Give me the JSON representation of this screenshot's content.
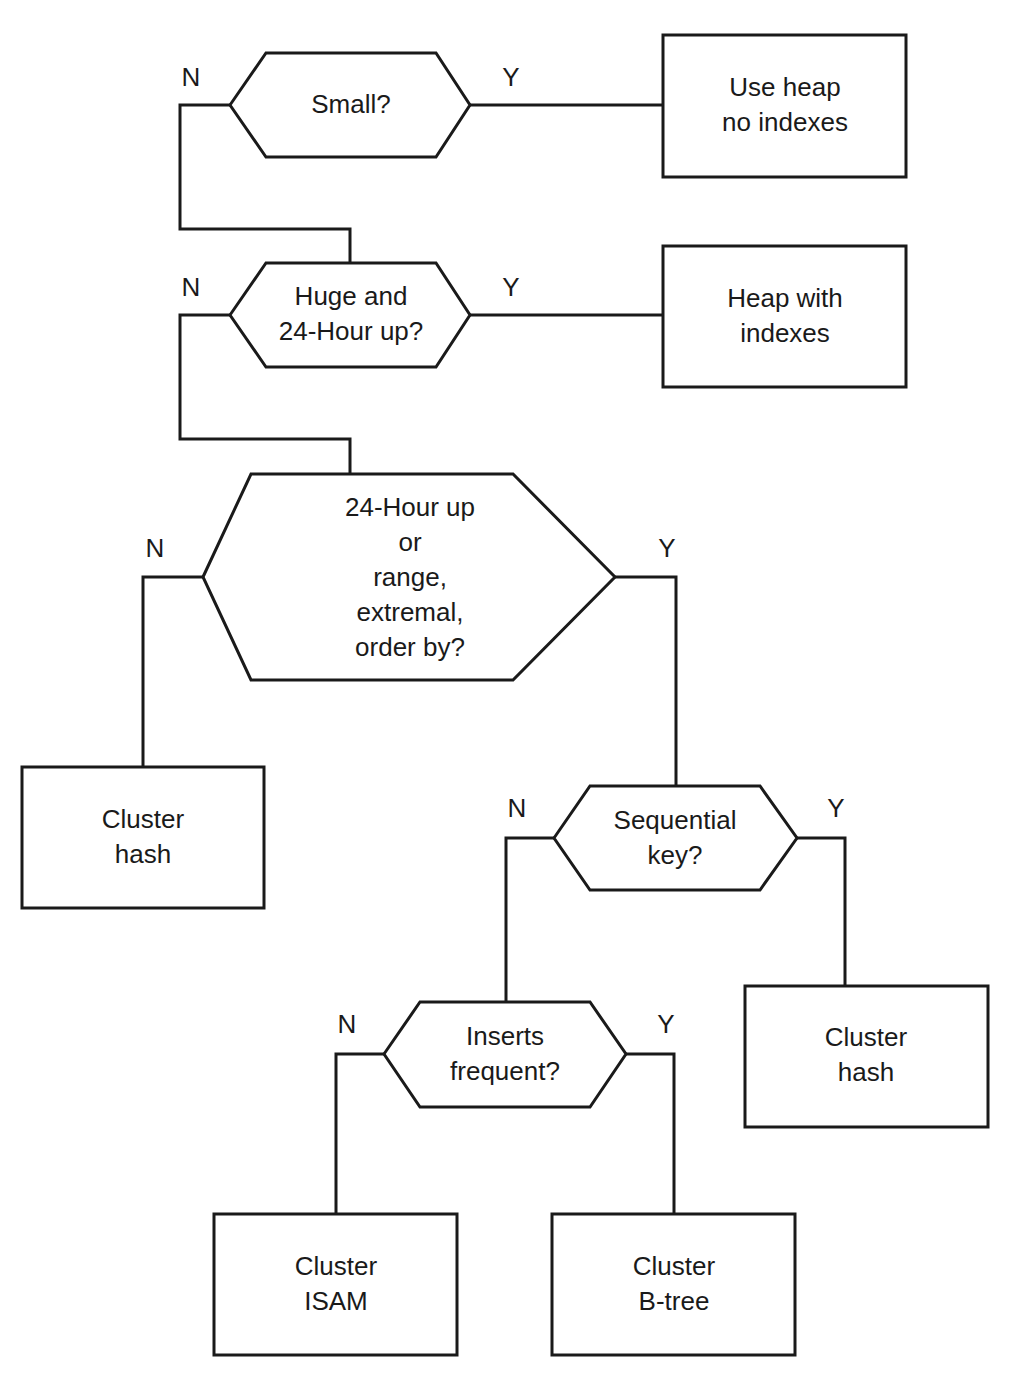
{
  "diagram": {
    "type": "flowchart",
    "colors": {
      "line": "#1a1a1a",
      "background": "#ffffff"
    },
    "decisions": [
      {
        "id": "small",
        "label": "Small?",
        "yes_label": "Y",
        "no_label": "N"
      },
      {
        "id": "huge",
        "label": "Huge and\n24-Hour up?",
        "yes_label": "Y",
        "no_label": "N"
      },
      {
        "id": "range",
        "label": "24-Hour up\nor\nrange,\nextremal,\norder by?",
        "yes_label": "Y",
        "no_label": "N"
      },
      {
        "id": "sequential",
        "label": "Sequential\nkey?",
        "yes_label": "Y",
        "no_label": "N"
      },
      {
        "id": "inserts",
        "label": "Inserts\nfrequent?",
        "yes_label": "Y",
        "no_label": "N"
      }
    ],
    "outcomes": [
      {
        "id": "heap-no-index",
        "label": "Use heap\nno indexes"
      },
      {
        "id": "heap-with-index",
        "label": "Heap with\nindexes"
      },
      {
        "id": "cluster-hash-left",
        "label": "Cluster\nhash"
      },
      {
        "id": "cluster-hash-right",
        "label": "Cluster\nhash"
      },
      {
        "id": "cluster-isam",
        "label": "Cluster\nISAM"
      },
      {
        "id": "cluster-btree",
        "label": "Cluster\nB-tree"
      }
    ],
    "edges": [
      {
        "from": "small",
        "to": "heap-no-index",
        "label": "Y"
      },
      {
        "from": "small",
        "to": "huge",
        "label": "N"
      },
      {
        "from": "huge",
        "to": "heap-with-index",
        "label": "Y"
      },
      {
        "from": "huge",
        "to": "range",
        "label": "N"
      },
      {
        "from": "range",
        "to": "cluster-hash-left",
        "label": "N"
      },
      {
        "from": "range",
        "to": "sequential",
        "label": "Y"
      },
      {
        "from": "sequential",
        "to": "cluster-hash-right",
        "label": "Y"
      },
      {
        "from": "sequential",
        "to": "inserts",
        "label": "N"
      },
      {
        "from": "inserts",
        "to": "cluster-isam",
        "label": "N"
      },
      {
        "from": "inserts",
        "to": "cluster-btree",
        "label": "Y"
      }
    ]
  }
}
